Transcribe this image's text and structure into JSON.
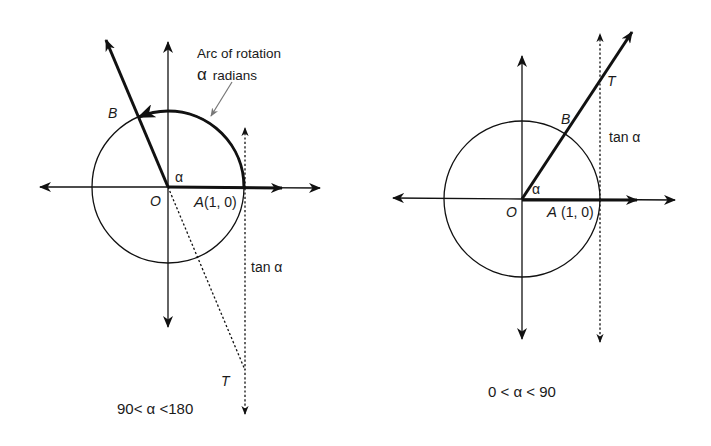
{
  "left_diagram": {
    "caption": "90< α <180",
    "annotation": {
      "line1": "Arc of rotation",
      "line2_symbol": "α",
      "line2_text": "radians"
    },
    "labels": {
      "B": "B",
      "O": "O",
      "A": "A",
      "A_coords": "(1, 0)",
      "alpha": "α",
      "tan": "tan α",
      "T": "T"
    }
  },
  "right_diagram": {
    "caption": "0 < α < 90",
    "labels": {
      "B": "B",
      "O": "O",
      "A": "A",
      "A_coords": "(1, 0)",
      "alpha": "α",
      "tan": "tan α",
      "T": "T"
    }
  }
}
